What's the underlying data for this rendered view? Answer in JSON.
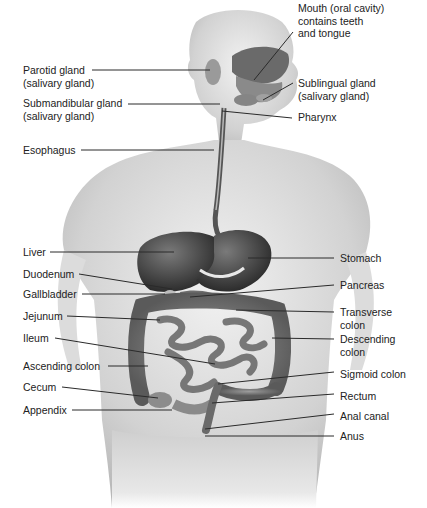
{
  "diagram": {
    "labels_left": [
      {
        "id": "parotid",
        "lines": [
          "Parotid gland",
          "(salivary gland)"
        ],
        "x": 23,
        "y": 64
      },
      {
        "id": "submandibular",
        "lines": [
          "Submandibular gland",
          "(salivary gland)"
        ],
        "x": 23,
        "y": 97
      },
      {
        "id": "esophagus",
        "lines": [
          "Esophagus"
        ],
        "x": 23,
        "y": 144
      },
      {
        "id": "liver",
        "lines": [
          "Liver"
        ],
        "x": 23,
        "y": 246
      },
      {
        "id": "duodenum",
        "lines": [
          "Duodenum"
        ],
        "x": 23,
        "y": 268
      },
      {
        "id": "gallbladder",
        "lines": [
          "Gallbladder"
        ],
        "x": 23,
        "y": 288
      },
      {
        "id": "jejunum",
        "lines": [
          "Jejunum"
        ],
        "x": 23,
        "y": 310
      },
      {
        "id": "ileum",
        "lines": [
          "Ileum"
        ],
        "x": 23,
        "y": 332
      },
      {
        "id": "ascending-colon",
        "lines": [
          "Ascending colon"
        ],
        "x": 23,
        "y": 360
      },
      {
        "id": "cecum",
        "lines": [
          "Cecum"
        ],
        "x": 23,
        "y": 381
      },
      {
        "id": "appendix",
        "lines": [
          "Appendix"
        ],
        "x": 23,
        "y": 404
      }
    ],
    "labels_right": [
      {
        "id": "mouth",
        "lines": [
          "Mouth (oral cavity)",
          "contains teeth",
          "and tongue"
        ],
        "x": 298,
        "y": 2
      },
      {
        "id": "sublingual",
        "lines": [
          "Sublingual gland",
          "(salivary gland)"
        ],
        "x": 298,
        "y": 77
      },
      {
        "id": "pharynx",
        "lines": [
          "Pharynx"
        ],
        "x": 298,
        "y": 111
      },
      {
        "id": "stomach",
        "lines": [
          "Stomach"
        ],
        "x": 340,
        "y": 252
      },
      {
        "id": "pancreas",
        "lines": [
          "Pancreas"
        ],
        "x": 340,
        "y": 279
      },
      {
        "id": "transverse-colon",
        "lines": [
          "Transverse",
          "colon"
        ],
        "x": 340,
        "y": 306
      },
      {
        "id": "descending-colon",
        "lines": [
          "Descending",
          "colon"
        ],
        "x": 340,
        "y": 333
      },
      {
        "id": "sigmoid-colon",
        "lines": [
          "Sigmoid colon"
        ],
        "x": 340,
        "y": 368
      },
      {
        "id": "rectum",
        "lines": [
          "Rectum"
        ],
        "x": 340,
        "y": 390
      },
      {
        "id": "anal-canal",
        "lines": [
          "Anal canal"
        ],
        "x": 340,
        "y": 410
      },
      {
        "id": "anus",
        "lines": [
          "Anus"
        ],
        "x": 340,
        "y": 430
      }
    ],
    "leaders": [
      {
        "for": "parotid",
        "x1": 92,
        "y1": 70,
        "x2": 210,
        "y2": 70
      },
      {
        "for": "submandibular",
        "x1": 128,
        "y1": 104,
        "x2": 220,
        "y2": 104
      },
      {
        "for": "esophagus",
        "x1": 81,
        "y1": 150,
        "x2": 214,
        "y2": 150
      },
      {
        "for": "liver",
        "x1": 50,
        "y1": 252,
        "x2": 174,
        "y2": 252
      },
      {
        "for": "duodenum",
        "x1": 79,
        "y1": 274,
        "x2": 172,
        "y2": 289
      },
      {
        "for": "gallbladder",
        "x1": 82,
        "y1": 294,
        "x2": 165,
        "y2": 294
      },
      {
        "for": "jejunum",
        "x1": 67,
        "y1": 316,
        "x2": 160,
        "y2": 320
      },
      {
        "for": "ileum",
        "x1": 55,
        "y1": 338,
        "x2": 215,
        "y2": 364
      },
      {
        "for": "ascending-colon",
        "x1": 108,
        "y1": 366,
        "x2": 148,
        "y2": 366
      },
      {
        "for": "cecum",
        "x1": 62,
        "y1": 387,
        "x2": 158,
        "y2": 398
      },
      {
        "for": "appendix",
        "x1": 72,
        "y1": 410,
        "x2": 172,
        "y2": 410
      },
      {
        "for": "mouth",
        "x1": 293,
        "y1": 32,
        "x2": 254,
        "y2": 80
      },
      {
        "for": "sublingual",
        "x1": 293,
        "y1": 83,
        "x2": 263,
        "y2": 100
      },
      {
        "for": "pharynx",
        "x1": 292,
        "y1": 118,
        "x2": 222,
        "y2": 111
      },
      {
        "for": "stomach",
        "x1": 334,
        "y1": 258,
        "x2": 248,
        "y2": 258
      },
      {
        "for": "pancreas",
        "x1": 334,
        "y1": 285,
        "x2": 190,
        "y2": 297
      },
      {
        "for": "transverse-colon",
        "x1": 334,
        "y1": 312,
        "x2": 236,
        "y2": 310
      },
      {
        "for": "descending-colon",
        "x1": 334,
        "y1": 339,
        "x2": 272,
        "y2": 338
      },
      {
        "for": "sigmoid-colon",
        "x1": 334,
        "y1": 372,
        "x2": 218,
        "y2": 384
      },
      {
        "for": "rectum",
        "x1": 334,
        "y1": 394,
        "x2": 212,
        "y2": 403
      },
      {
        "for": "anal-canal",
        "x1": 334,
        "y1": 414,
        "x2": 205,
        "y2": 429
      },
      {
        "for": "anus",
        "x1": 334,
        "y1": 436,
        "x2": 205,
        "y2": 436
      }
    ],
    "colors": {
      "leader": "#2a2a2a",
      "skin": "#d6d6d6",
      "organ_dark": "#3c3c3c",
      "organ_mid": "#6b6b6b",
      "intestine": "#8a8a8a",
      "text": "#222222"
    }
  }
}
